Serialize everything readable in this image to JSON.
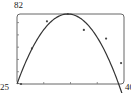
{
  "chart_data": {
    "type": "scatter",
    "title": "",
    "xlabel": "",
    "ylabel": "",
    "xlim": [
      0,
      40
    ],
    "ylim": [
      25,
      82
    ],
    "labels": {
      "y_max": "82",
      "y_min": "25",
      "x_max": "40"
    },
    "x_ticks": [
      10,
      20,
      30
    ],
    "y_ticks": [
      35,
      45,
      55,
      65,
      75
    ],
    "grid": false,
    "legend": null,
    "series": [
      {
        "name": "data points",
        "type": "scatter",
        "points": [
          {
            "x": 1.5,
            "y": 25
          },
          {
            "x": 5.6,
            "y": 54
          },
          {
            "x": 11.2,
            "y": 76
          },
          {
            "x": 19,
            "y": 82
          },
          {
            "x": 25,
            "y": 69
          },
          {
            "x": 33.3,
            "y": 62
          },
          {
            "x": 38.9,
            "y": 42
          }
        ]
      },
      {
        "name": "fitted quadratic",
        "type": "line",
        "peak": {
          "x": 19,
          "y": 82
        },
        "endpoints": [
          {
            "x": 0,
            "y": 25
          },
          {
            "x": 40,
            "y": 33
          }
        ]
      }
    ],
    "colors": {
      "frame": "#555555",
      "curve": "#333333",
      "points": "#444444"
    }
  }
}
